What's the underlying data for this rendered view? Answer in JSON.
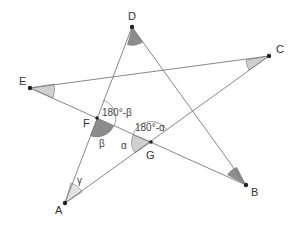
{
  "diagram": {
    "colors": {
      "line": "#7a7a7a",
      "point": "#222222",
      "angle_dark": "#8c8c8c",
      "angle_light": "#cfcfcf",
      "arc": "#888888",
      "text": "#333333"
    },
    "points": {
      "A": {
        "label": "A",
        "x": 65,
        "y": 203
      },
      "B": {
        "label": "B",
        "x": 246,
        "y": 185
      },
      "C": {
        "label": "C",
        "x": 269,
        "y": 56
      },
      "D": {
        "label": "D",
        "x": 132,
        "y": 27
      },
      "E": {
        "label": "E",
        "x": 30,
        "y": 88
      },
      "F": {
        "label": "F",
        "x": 97,
        "y": 118
      },
      "G": {
        "label": "G",
        "x": 151,
        "y": 142
      }
    },
    "segments": [
      [
        "A",
        "D"
      ],
      [
        "D",
        "B"
      ],
      [
        "E",
        "B"
      ],
      [
        "E",
        "C"
      ],
      [
        "A",
        "C"
      ]
    ],
    "angle_labels": {
      "gamma": "γ",
      "beta": "β",
      "alpha": "α",
      "supp_beta": "180°-β",
      "supp_alpha": "180°-α"
    }
  }
}
